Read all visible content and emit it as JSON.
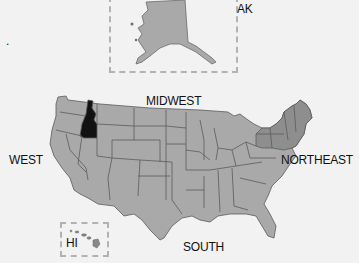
{
  "map": {
    "type": "US census regions map",
    "colors": {
      "background": "#f2f2f2",
      "state_fill": "#a9a9a9",
      "northeast_fill": "#8e8e8e",
      "highlight_fill": "#111111",
      "border": "#5a5a5a",
      "inset_border": "#b2b2b2"
    },
    "highlighted_state": "Idaho",
    "regions": [
      {
        "name": "WEST",
        "label": "WEST"
      },
      {
        "name": "MIDWEST",
        "label": "MIDWEST"
      },
      {
        "name": "NORTHEAST",
        "label": "NORTHEAST"
      },
      {
        "name": "SOUTH",
        "label": "SOUTH"
      }
    ],
    "insets": [
      {
        "name": "Alaska",
        "label": "AK"
      },
      {
        "name": "Hawaii",
        "label": "HI"
      }
    ],
    "stray_mark": "."
  }
}
